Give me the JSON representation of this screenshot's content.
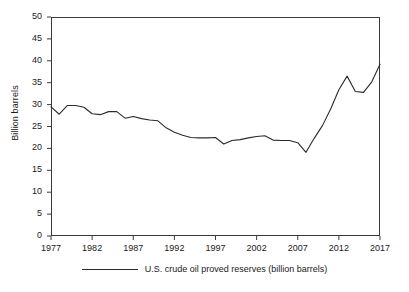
{
  "chart_data": {
    "type": "line",
    "title": "",
    "subtitle": "",
    "xlabel": "",
    "ylabel": "Billion barrels",
    "xlim": [
      1977,
      2017
    ],
    "ylim": [
      0,
      50
    ],
    "grid": false,
    "legend_position": "bottom-center",
    "xticks": [
      "1977",
      "1982",
      "1987",
      "1992",
      "1997",
      "2002",
      "2007",
      "2012",
      "2017"
    ],
    "xtick_values": [
      1977,
      1982,
      1987,
      1992,
      1997,
      2002,
      2007,
      2012,
      2017
    ],
    "yticks": [
      "0",
      "5",
      "10",
      "15",
      "20",
      "25",
      "30",
      "35",
      "40",
      "45",
      "50"
    ],
    "ytick_values": [
      0,
      5,
      10,
      15,
      20,
      25,
      30,
      35,
      40,
      45,
      50
    ],
    "line_color": "#2b2b2b",
    "x": [
      1977,
      1978,
      1979,
      1980,
      1981,
      1982,
      1983,
      1984,
      1985,
      1986,
      1987,
      1988,
      1989,
      1990,
      1991,
      1992,
      1993,
      1994,
      1995,
      1996,
      1997,
      1998,
      1999,
      2000,
      2001,
      2002,
      2003,
      2004,
      2005,
      2006,
      2007,
      2008,
      2009,
      2010,
      2011,
      2012,
      2013,
      2014,
      2015,
      2016,
      2017
    ],
    "series": [
      {
        "name": "U.S. crude oil proved reserves (billion barrels)",
        "values": [
          29.5,
          27.8,
          29.8,
          29.8,
          29.4,
          27.9,
          27.7,
          28.4,
          28.4,
          26.9,
          27.3,
          26.8,
          26.5,
          26.3,
          24.7,
          23.7,
          23.0,
          22.5,
          22.4,
          22.4,
          22.5,
          21.0,
          21.8,
          22.0,
          22.4,
          22.7,
          22.9,
          21.9,
          21.8,
          21.8,
          21.3,
          19.1,
          22.3,
          25.2,
          29.0,
          33.4,
          36.5,
          33.0,
          32.8,
          35.2,
          39.2
        ]
      }
    ],
    "annotations": []
  },
  "legend": {
    "entries": [
      {
        "label": "U.S. crude oil proved reserves (billion barrels)",
        "color": "#2b2b2b",
        "style": "solid-line"
      }
    ]
  }
}
